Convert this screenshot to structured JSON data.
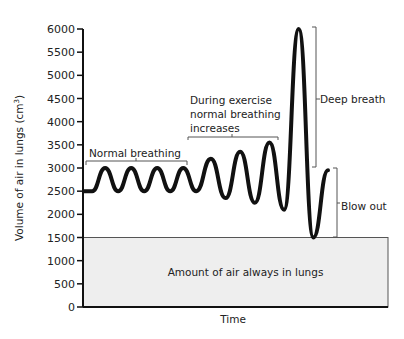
{
  "chart_data": {
    "type": "line",
    "title": "",
    "xlabel": "Time",
    "ylabel": "Volume of air in lungs (cm³)",
    "ylabel_base": "Volume of air in lungs (cm",
    "ylabel_sup": "3",
    "ylabel_close": ")",
    "ylim": [
      0,
      6000
    ],
    "yticks": [
      0,
      500,
      1000,
      1500,
      2000,
      2500,
      3000,
      3500,
      4000,
      4500,
      5000,
      5500,
      6000
    ],
    "grid": false,
    "series": [
      {
        "name": "Lung volume",
        "points": [
          [
            0,
            2500
          ],
          [
            0.05,
            2500
          ],
          [
            0.13,
            3000
          ],
          [
            0.21,
            2500
          ],
          [
            0.29,
            3000
          ],
          [
            0.37,
            2500
          ],
          [
            0.45,
            3000
          ],
          [
            0.53,
            2500
          ],
          [
            0.61,
            3000
          ],
          [
            0.69,
            2500
          ],
          [
            0.78,
            3200
          ],
          [
            0.87,
            2350
          ],
          [
            0.96,
            3350
          ],
          [
            1.05,
            2250
          ],
          [
            1.14,
            3550
          ],
          [
            1.23,
            2100
          ],
          [
            1.32,
            6000
          ],
          [
            1.41,
            1500
          ],
          [
            1.5,
            2950
          ]
        ]
      }
    ],
    "shaded_region": {
      "from": 0,
      "to": 1500,
      "label": "Amount of air always in lungs"
    },
    "annotations": [
      {
        "text": "Normal breathing",
        "lines": [
          "Normal breathing"
        ]
      },
      {
        "text": "During exercise normal breathing increases",
        "lines": [
          "During exercise",
          "normal breathing",
          "increases"
        ]
      },
      {
        "text": "Deep breath",
        "lines": [
          "Deep breath"
        ]
      },
      {
        "text": "Blow out",
        "lines": [
          "Blow out"
        ]
      }
    ]
  }
}
